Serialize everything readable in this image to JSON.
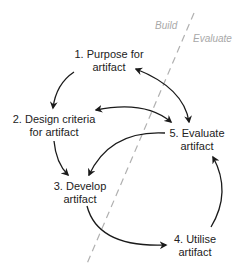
{
  "zones": {
    "left": "Build",
    "right": "Evaluate"
  },
  "nodes": [
    {
      "id": 1,
      "line1": "1. Purpose for",
      "line2": "artifact"
    },
    {
      "id": 2,
      "line1": "2. Design criteria",
      "line2": "for artifact"
    },
    {
      "id": 3,
      "line1": "3. Develop",
      "line2": "artifact"
    },
    {
      "id": 4,
      "line1": "4. Utilise",
      "line2": "artifact"
    },
    {
      "id": 5,
      "line1": "5. Evaluate",
      "line2": "artifact"
    }
  ],
  "edges": [
    {
      "from": 1,
      "to": 2,
      "type": "directed"
    },
    {
      "from": 2,
      "to": 3,
      "type": "directed"
    },
    {
      "from": 3,
      "to": 4,
      "type": "directed"
    },
    {
      "from": 4,
      "to": 5,
      "type": "directed"
    },
    {
      "from": 5,
      "to": 3,
      "type": "directed"
    },
    {
      "from": 1,
      "to": 5,
      "type": "bidirectional"
    },
    {
      "from": 2,
      "to": 5,
      "type": "bidirectional"
    }
  ],
  "colors": {
    "text": "#222222",
    "arrow": "#1a1a1a",
    "divider": "#b0b0b0",
    "zone_label": "#a8a8a8"
  }
}
